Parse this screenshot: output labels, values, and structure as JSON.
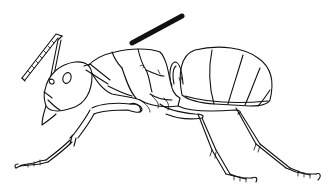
{
  "figure": {
    "style": "black line drawing on white",
    "view": "lateral (side) view, head facing left",
    "annotation": {
      "type": "arrow-bar",
      "points_to": "mesosoma (thorax)",
      "color": "#111111"
    },
    "colors": {
      "background": "#ffffff",
      "line": "#111111"
    }
  }
}
